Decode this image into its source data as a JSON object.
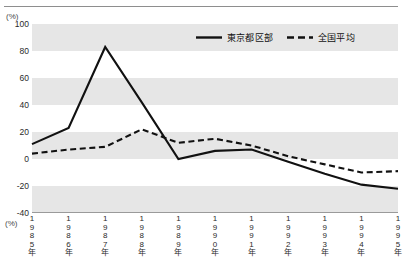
{
  "unit_caption_top": "(%)",
  "unit_caption_bottom": "(%)",
  "legend": {
    "entries": [
      {
        "label": "東京都区部",
        "style": "solid",
        "color": "#111111",
        "icon": "solid-line-icon"
      },
      {
        "label": "全国平均",
        "style": "dashed",
        "color": "#111111",
        "icon": "dashed-line-icon"
      }
    ]
  },
  "chart_data": {
    "type": "line",
    "title": "",
    "subtitle": "",
    "xlabel": "",
    "ylabel": "(%)",
    "x": [
      "1985年",
      "1986年",
      "1987年",
      "1988年",
      "1989年",
      "1990年",
      "1991年",
      "1992年",
      "1993年",
      "1994年",
      "1995年"
    ],
    "categories": [
      "1985年",
      "1986年",
      "1987年",
      "1988年",
      "1989年",
      "1990年",
      "1991年",
      "1992年",
      "1993年",
      "1994年",
      "1995年"
    ],
    "tick_labels_y": [
      "100",
      "80",
      "60",
      "40",
      "20",
      "0",
      "-20",
      "-40"
    ],
    "ylim": [
      -40,
      100
    ],
    "ytick_step": 20,
    "grid": "alternating-horizontal-bands",
    "band_color": "#e6e6e6",
    "legend_position": "top-center-right",
    "series": [
      {
        "name": "東京都区部",
        "style": "solid",
        "color": "#111111",
        "values": [
          11,
          23,
          83,
          42,
          0,
          6,
          7,
          -2,
          -11,
          -19,
          -22
        ]
      },
      {
        "name": "全国平均",
        "style": "dashed",
        "color": "#111111",
        "values": [
          4,
          7,
          9,
          22,
          12,
          15,
          10,
          2,
          -4,
          -10,
          -9
        ]
      }
    ]
  }
}
